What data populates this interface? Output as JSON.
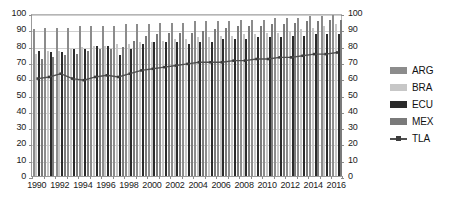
{
  "chart_data": {
    "type": "bar",
    "title": "",
    "xlabel": "",
    "ylabel": "",
    "ylim": [
      0,
      100
    ],
    "y_ticks": [
      0,
      10,
      20,
      30,
      40,
      50,
      60,
      70,
      80,
      90,
      100
    ],
    "secondary_y_ticks": [
      0,
      10,
      20,
      30,
      40,
      50,
      60,
      70,
      80,
      90,
      100
    ],
    "grid": true,
    "legend_position": "right",
    "categories": [
      1990,
      1991,
      1992,
      1993,
      1994,
      1995,
      1996,
      1997,
      1998,
      1999,
      2000,
      2001,
      2002,
      2003,
      2004,
      2005,
      2006,
      2007,
      2008,
      2009,
      2010,
      2011,
      2012,
      2013,
      2014,
      2015,
      2016
    ],
    "tick_labels": [
      "1990",
      "1992",
      "1994",
      "1996",
      "1998",
      "2000",
      "2002",
      "2004",
      "2006",
      "2008",
      "2010",
      "2012",
      "2014",
      "2016"
    ],
    "series": [
      {
        "name": "ARG",
        "type": "bar",
        "color": "#8c8c8c",
        "values": [
          90,
          91,
          91,
          91,
          92,
          92,
          92,
          92,
          93,
          93,
          93,
          94,
          94,
          94,
          95,
          95,
          95,
          95,
          96,
          96,
          96,
          97,
          97,
          97,
          98,
          98,
          99
        ]
      },
      {
        "name": "BRA",
        "type": "bar",
        "color": "#c7c7c7",
        "values": [
          75,
          77,
          77,
          78,
          79,
          80,
          80,
          81,
          81,
          82,
          82,
          83,
          84,
          84,
          85,
          85,
          86,
          86,
          87,
          87,
          88,
          88,
          89,
          90,
          91,
          92,
          93
        ]
      },
      {
        "name": "ECU",
        "type": "bar",
        "color": "#2b2b2b",
        "values": [
          77,
          76,
          76,
          78,
          78,
          80,
          80,
          74,
          78,
          81,
          82,
          82,
          82,
          81,
          82,
          82,
          84,
          84,
          84,
          85,
          85,
          85,
          86,
          86,
          87,
          87,
          87
        ]
      },
      {
        "name": "MEX",
        "type": "bar",
        "color": "#7a7a7a",
        "values": [
          72,
          73,
          74,
          75,
          77,
          78,
          78,
          79,
          83,
          86,
          87,
          88,
          88,
          88,
          89,
          90,
          91,
          92,
          92,
          92,
          93,
          93,
          94,
          95,
          95,
          96,
          96
        ]
      },
      {
        "name": "TLA",
        "type": "line",
        "color": "#4f4f4f",
        "values": [
          61,
          62,
          64,
          61,
          60,
          62,
          63,
          62,
          64,
          66,
          67,
          68,
          69,
          70,
          71,
          71,
          71,
          72,
          72,
          73,
          73,
          74,
          74,
          75,
          76,
          76,
          77
        ]
      }
    ]
  },
  "legend": {
    "items": [
      {
        "label": "ARG",
        "marker": "bar"
      },
      {
        "label": "BRA",
        "marker": "bar"
      },
      {
        "label": "ECU",
        "marker": "bar"
      },
      {
        "label": "MEX",
        "marker": "bar"
      },
      {
        "label": "TLA",
        "marker": "line"
      }
    ]
  }
}
